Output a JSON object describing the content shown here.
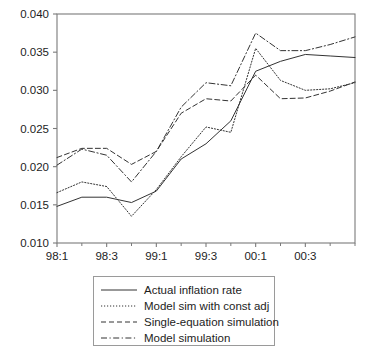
{
  "chart_data": {
    "type": "line",
    "title": "",
    "xlabel": "",
    "ylabel": "",
    "ylim": [
      0.01,
      0.04
    ],
    "ytick_values": [
      0.01,
      0.015,
      0.02,
      0.025,
      0.03,
      0.035,
      0.04
    ],
    "ytick_labels": [
      "0.010",
      "0.015",
      "0.020",
      "0.025",
      "0.030",
      "0.035",
      "0.040"
    ],
    "x": [
      "98:1",
      "98:2",
      "98:3",
      "98:4",
      "99:1",
      "99:2",
      "99:3",
      "99:4",
      "00:1",
      "00:2",
      "00:3",
      "00:4",
      "01:1"
    ],
    "xtick_labels": [
      "98:1",
      "98:3",
      "99:1",
      "99:3",
      "00:1",
      "00:3"
    ],
    "xtick_indices": [
      0,
      2,
      4,
      6,
      8,
      10
    ],
    "grid": false,
    "legend_position": "below",
    "series": [
      {
        "name": "Actual inflation rate",
        "style": "solid",
        "color": "#333333",
        "values": [
          0.0148,
          0.016,
          0.016,
          0.0153,
          0.0168,
          0.021,
          0.023,
          0.026,
          0.0325,
          0.0338,
          0.0347,
          0.0345,
          0.0343
        ]
      },
      {
        "name": "Model sim with const adj",
        "style": "dotted",
        "color": "#333333",
        "values": [
          0.0166,
          0.018,
          0.0174,
          0.0135,
          0.017,
          0.0213,
          0.0252,
          0.0245,
          0.0355,
          0.0313,
          0.03,
          0.0302,
          0.031
        ]
      },
      {
        "name": "Single-equation simulation",
        "style": "dashed",
        "color": "#333333",
        "values": [
          0.0212,
          0.0224,
          0.0224,
          0.0203,
          0.022,
          0.027,
          0.0289,
          0.0286,
          0.032,
          0.0289,
          0.029,
          0.0299,
          0.0311
        ]
      },
      {
        "name": "Model simulation",
        "style": "dashdot",
        "color": "#333333",
        "values": [
          0.0202,
          0.0223,
          0.0215,
          0.018,
          0.022,
          0.0278,
          0.031,
          0.0306,
          0.0375,
          0.0352,
          0.0352,
          0.036,
          0.037
        ]
      }
    ]
  },
  "legend": {
    "items": [
      {
        "label": "Actual inflation rate",
        "style": "solid"
      },
      {
        "label": "Model sim with const adj",
        "style": "dotted"
      },
      {
        "label": "Single-equation simulation",
        "style": "dashed"
      },
      {
        "label": "Model simulation",
        "style": "dashdot"
      }
    ]
  },
  "axes": {
    "frame_color": "#7a7a7a"
  }
}
